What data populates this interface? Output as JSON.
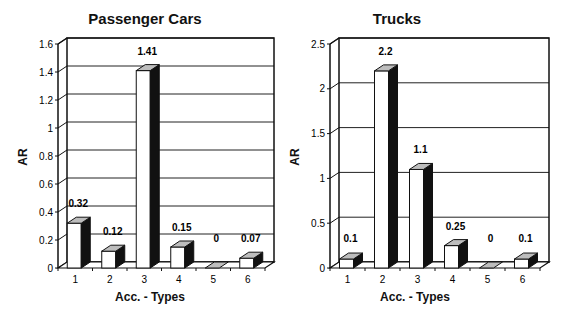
{
  "chart_data": [
    {
      "type": "bar",
      "title": "Passenger Cars",
      "xlabel": "Acc. - Types",
      "ylabel": "AR",
      "categories": [
        "1",
        "2",
        "3",
        "4",
        "5",
        "6"
      ],
      "values": [
        0.32,
        0.12,
        1.41,
        0.15,
        0,
        0.07
      ],
      "value_labels": [
        "0.32",
        "0.12",
        "1.41",
        "0.15",
        "0",
        "0.07"
      ],
      "ylim": [
        0,
        1.6
      ],
      "yticks": [
        "0",
        "0.2",
        "0.4",
        "0.6",
        "0.8",
        "1",
        "1.2",
        "1.4",
        "1.6"
      ],
      "grid": true,
      "style": "3d"
    },
    {
      "type": "bar",
      "title": "Trucks",
      "xlabel": "Acc. - Types",
      "ylabel": "AR",
      "categories": [
        "1",
        "2",
        "3",
        "4",
        "5",
        "6"
      ],
      "values": [
        0.1,
        2.2,
        1.1,
        0.25,
        0,
        0.1
      ],
      "value_labels": [
        "0.1",
        "2.2",
        "1.1",
        "0.25",
        "0",
        "0.1"
      ],
      "ylim": [
        0,
        2.5
      ],
      "yticks": [
        "0",
        "0.5",
        "1",
        "1.5",
        "2",
        "2.5"
      ],
      "grid": true,
      "style": "3d"
    }
  ],
  "charts": {
    "left": {
      "title": "Passenger Cars",
      "xlabel": "Acc. - Types",
      "ylabel": "AR"
    },
    "right": {
      "title": "Trucks",
      "xlabel": "Acc. - Types",
      "ylabel": "AR"
    }
  },
  "colors": {
    "bar_front": "#ffffff",
    "bar_side": "#111111",
    "bar_top": "#bdbdbd",
    "grid": "#222222",
    "axis": "#111111"
  }
}
